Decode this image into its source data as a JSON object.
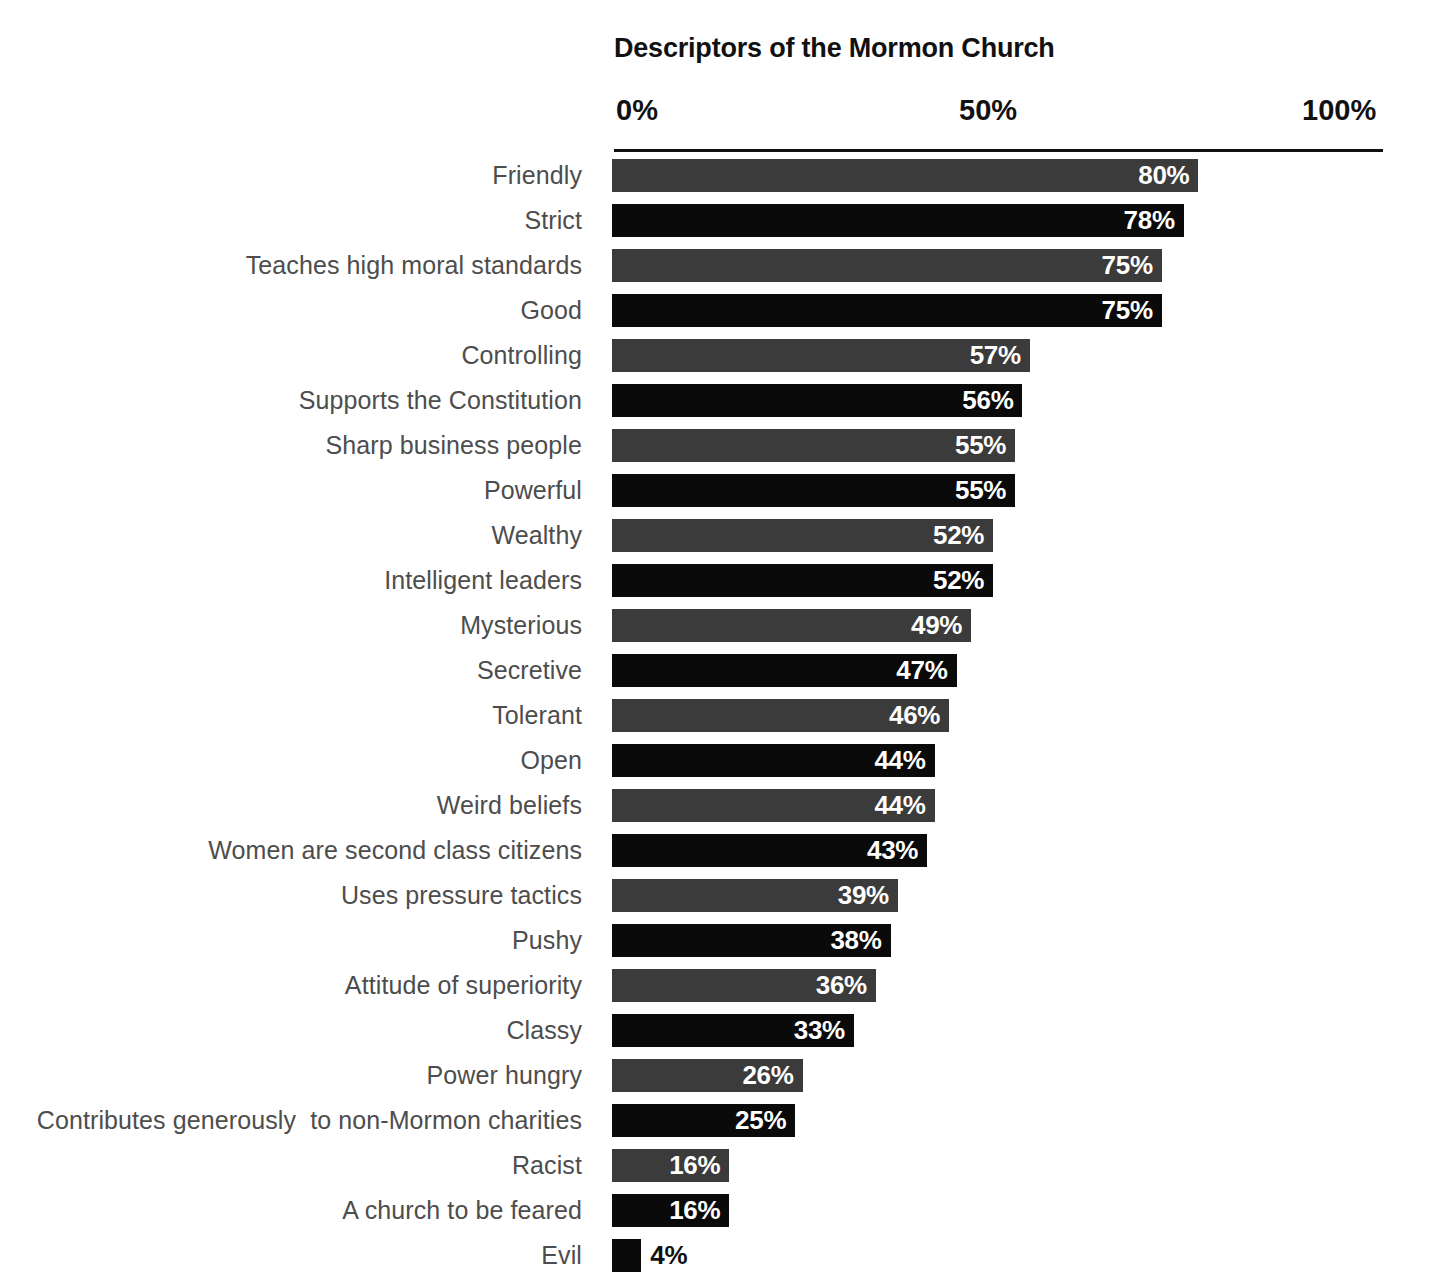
{
  "chart_data": {
    "type": "bar",
    "orientation": "horizontal",
    "title": "Descriptors of the Mormon Church",
    "xlabel": "",
    "ylabel": "",
    "xlim": [
      0,
      100
    ],
    "grid": false,
    "legend": null,
    "axis_ticks": [
      "0%",
      "50%",
      "100%"
    ],
    "axis_tick_values": [
      0,
      50,
      100
    ],
    "value_suffix": "%",
    "categories": [
      "Friendly",
      "Strict",
      "Teaches high moral standards",
      "Good",
      "Controlling",
      "Supports the Constitution",
      "Sharp business people",
      "Powerful",
      "Wealthy",
      "Intelligent leaders",
      "Mysterious",
      "Secretive",
      "Tolerant",
      "Open",
      "Weird beliefs",
      "Women are second class citizens",
      "Uses pressure tactics",
      "Pushy",
      "Attitude of superiority",
      "Classy",
      "Power hungry",
      "Contributes generously  to non-Mormon charities",
      "Racist",
      "A church to be feared",
      "Evil"
    ],
    "values": [
      80,
      78,
      75,
      75,
      57,
      56,
      55,
      55,
      52,
      52,
      49,
      47,
      46,
      44,
      44,
      43,
      39,
      38,
      36,
      33,
      26,
      25,
      16,
      16,
      4
    ],
    "value_labels": [
      "80%",
      "78%",
      "75%",
      "75%",
      "57%",
      "56%",
      "55%",
      "55%",
      "52%",
      "52%",
      "49%",
      "47%",
      "46%",
      "44%",
      "44%",
      "43%",
      "39%",
      "38%",
      "36%",
      "33%",
      "26%",
      "25%",
      "16%",
      "16%",
      "4%"
    ],
    "bar_tones": [
      "gray",
      "black",
      "gray",
      "black",
      "gray",
      "black",
      "gray",
      "black",
      "gray",
      "black",
      "gray",
      "black",
      "gray",
      "black",
      "gray",
      "black",
      "gray",
      "black",
      "gray",
      "black",
      "gray",
      "black",
      "gray",
      "black",
      "black"
    ],
    "label_placement": [
      "inside",
      "inside",
      "inside",
      "inside",
      "inside",
      "inside",
      "inside",
      "inside",
      "inside",
      "inside",
      "inside",
      "inside",
      "inside",
      "inside",
      "inside",
      "inside",
      "inside",
      "inside",
      "inside",
      "inside",
      "inside",
      "inside",
      "inside",
      "inside",
      "outside"
    ],
    "colors": {
      "bar_gray": "#3b3b3b",
      "bar_black": "#0a0a0a",
      "background": "#ffffff",
      "title_text": "#111111",
      "tick_text": "#111111",
      "category_text": "#4d4d4d",
      "value_text_inside": "#ffffff",
      "value_text_outside": "#111111",
      "axis_line": "#111111"
    }
  }
}
